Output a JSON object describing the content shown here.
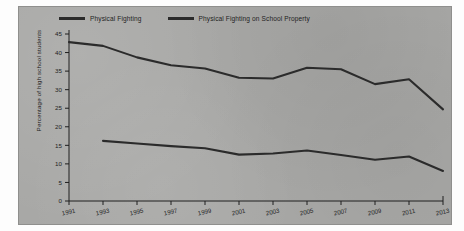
{
  "figure": {
    "background_color": "#a8a8a6",
    "border_color": "#8f8f8d",
    "line_color": "#2b2b2b",
    "axis_color": "#1e1e1e"
  },
  "legend": {
    "position": "top",
    "entries": [
      {
        "label": "Physical Fighting",
        "color": "#2b2b2b"
      },
      {
        "label": "Physical Fighting on School Property",
        "color": "#2b2b2b"
      }
    ]
  },
  "chart_data": {
    "type": "line",
    "title": "",
    "xlabel": "",
    "ylabel": "Percentage of high school students",
    "x": [
      1991,
      1993,
      1995,
      1997,
      1999,
      2001,
      2003,
      2005,
      2007,
      2009,
      2011,
      2013
    ],
    "xtick_labels": [
      "1991",
      "1993",
      "1995",
      "1997",
      "1999",
      "2001",
      "2003",
      "2005",
      "2007",
      "2009",
      "2011",
      "2013"
    ],
    "ytick_labels": [
      "0",
      "5",
      "10",
      "15",
      "20",
      "25",
      "30",
      "35",
      "40",
      "45"
    ],
    "yticks": [
      0,
      5,
      10,
      15,
      20,
      25,
      30,
      35,
      40,
      45
    ],
    "ylim": [
      0,
      45
    ],
    "xlim": [
      1991,
      2013
    ],
    "grid": false,
    "series": [
      {
        "name": "Physical Fighting",
        "color": "#2b2b2b",
        "x": [
          1991,
          1993,
          1995,
          1997,
          1999,
          2001,
          2003,
          2005,
          2007,
          2009,
          2011,
          2013
        ],
        "values": [
          42.8,
          41.8,
          38.7,
          36.6,
          35.7,
          33.2,
          33.0,
          35.9,
          35.5,
          31.5,
          32.8,
          24.7
        ]
      },
      {
        "name": "Physical Fighting on School Property",
        "color": "#2b2b2b",
        "x": [
          1993,
          1995,
          1997,
          1999,
          2001,
          2003,
          2005,
          2007,
          2009,
          2011,
          2013
        ],
        "values": [
          16.2,
          15.5,
          14.8,
          14.2,
          12.5,
          12.8,
          13.6,
          12.4,
          11.1,
          12.0,
          8.1
        ]
      }
    ]
  }
}
